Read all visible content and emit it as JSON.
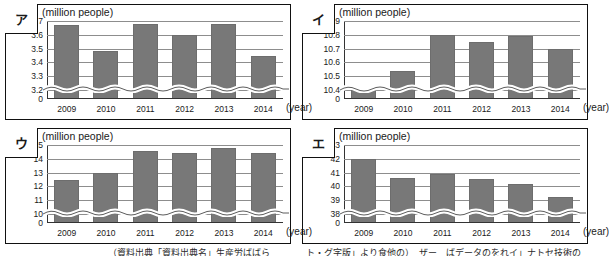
{
  "page": {
    "unit_label": "(million people)",
    "year_axis_label": "(year)",
    "categories": [
      "2009",
      "2010",
      "2011",
      "2012",
      "2013",
      "2014"
    ],
    "bar_color": "#787878",
    "gridline_color": "#8d8d8d",
    "axis_color": "#333333"
  },
  "caption": {
    "left_text": "（資料出典「資料出典名」生産労ばばら",
    "right_text": "ト・グ字版」より食他の）　ザー　ばデータのをれイ」ナトセ技術の"
  },
  "panels": [
    {
      "tag": "ア",
      "chart_data": {
        "type": "bar",
        "title": "",
        "xlabel": "(year)",
        "ylabel": "(million people)",
        "categories": [
          "2009",
          "2010",
          "2011",
          "2012",
          "2013",
          "2014"
        ],
        "values": [
          3.67,
          3.48,
          3.68,
          3.6,
          3.68,
          3.45
        ],
        "yticks": [
          "3.7",
          "3.6",
          "3.5",
          "3.4",
          "3.3",
          "3.2",
          "0"
        ],
        "ylim": [
          3.2,
          3.7
        ],
        "axis_break": true,
        "grid": true,
        "legend": "none"
      }
    },
    {
      "tag": "イ",
      "chart_data": {
        "type": "bar",
        "title": "",
        "xlabel": "(year)",
        "ylabel": "(million people)",
        "categories": [
          "2009",
          "2010",
          "2011",
          "2012",
          "2013",
          "2014"
        ],
        "values": [
          10.4,
          10.54,
          10.8,
          10.75,
          10.79,
          10.7
        ],
        "yticks": [
          "10.9",
          "10.8",
          "10.7",
          "10.6",
          "10.5",
          "10.4",
          "0"
        ],
        "ylim": [
          10.4,
          10.9
        ],
        "axis_break": true,
        "grid": true,
        "legend": "none"
      }
    },
    {
      "tag": "ウ",
      "chart_data": {
        "type": "bar",
        "title": "",
        "xlabel": "(year)",
        "ylabel": "(million people)",
        "categories": [
          "2009",
          "2010",
          "2011",
          "2012",
          "2013",
          "2014"
        ],
        "values": [
          12.5,
          13.0,
          14.55,
          14.45,
          14.8,
          14.45
        ],
        "yticks": [
          "15",
          "14",
          "13",
          "12",
          "11",
          "10",
          "0"
        ],
        "ylim": [
          10,
          15
        ],
        "axis_break": true,
        "grid": true,
        "legend": "none"
      }
    },
    {
      "tag": "エ",
      "chart_data": {
        "type": "bar",
        "title": "",
        "xlabel": "(year)",
        "ylabel": "(million people)",
        "categories": [
          "2009",
          "2010",
          "2011",
          "2012",
          "2013",
          "2014"
        ],
        "values": [
          42.0,
          40.6,
          40.9,
          40.55,
          40.15,
          39.25
        ],
        "yticks": [
          "43",
          "42",
          "41",
          "40",
          "39",
          "38",
          "0"
        ],
        "ylim": [
          38,
          43
        ],
        "axis_break": true,
        "grid": true,
        "legend": "none"
      }
    }
  ]
}
